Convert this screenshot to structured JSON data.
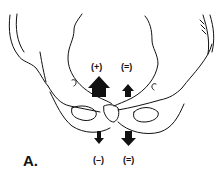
{
  "figure": {
    "panel_label": "A.",
    "labels": {
      "upper_left": "(+)",
      "upper_right": "(=)",
      "lower_left": "(–)",
      "lower_right": "(=)"
    },
    "arrows": [
      {
        "name": "large-up-arrow",
        "direction": "up",
        "size": "large"
      },
      {
        "name": "small-up-arrow",
        "direction": "up",
        "size": "small"
      },
      {
        "name": "small-down-arrow",
        "direction": "down",
        "size": "small"
      },
      {
        "name": "medium-down-arrow",
        "direction": "down",
        "size": "medium"
      }
    ],
    "colors": {
      "line": "#111111",
      "background": "#ffffff"
    }
  }
}
